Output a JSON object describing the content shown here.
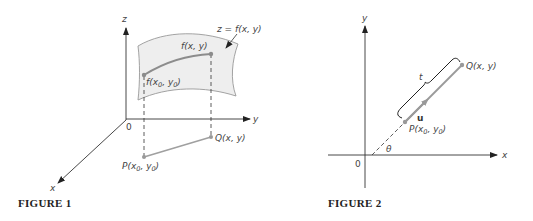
{
  "figure1": {
    "caption": "FIGURE 1",
    "axes": {
      "z": "z",
      "y": "y",
      "x": "x",
      "origin": "0"
    },
    "surface_label": "z = f(x, y)",
    "curve_end_label": "f(x, y)",
    "curve_start_label_main": "f(x",
    "curve_start_label_sub0": "0",
    "curve_start_label_mid": ", y",
    "curve_start_label_sub1": "0",
    "curve_start_label_close": ")",
    "point_q": "Q(x, y)",
    "point_p_main": "P(x",
    "point_p_sub0": "0",
    "point_p_mid": ", y",
    "point_p_sub1": "0",
    "point_p_close": ")",
    "colors": {
      "surface_fill": "#eeeeee",
      "curve": "#8c8c8c",
      "axis": "#333333"
    }
  },
  "figure2": {
    "caption": "FIGURE 2",
    "axes": {
      "y": "y",
      "x": "x",
      "origin": "0"
    },
    "angle_label": "θ",
    "brace_label": "t",
    "vector_label": "u",
    "point_q": "Q(x, y)",
    "point_p_main": "P(x",
    "point_p_sub0": "0",
    "point_p_mid": ", y",
    "point_p_sub1": "0",
    "point_p_close": ")",
    "colors": {
      "line": "#9a9a9a",
      "axis": "#333333"
    }
  }
}
